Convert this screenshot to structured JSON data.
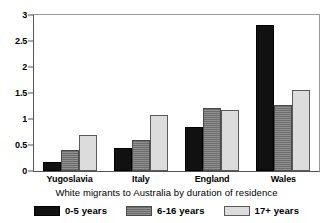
{
  "chart_data": {
    "type": "bar",
    "title": "",
    "subtitle": "",
    "xlabel": "White migrants to Australia by duration of residence",
    "ylabel": "",
    "categories": [
      "Yugoslavia",
      "Italy",
      "England",
      "Wales"
    ],
    "series": [
      {
        "name": "0-5 years",
        "values": [
          0.18,
          0.44,
          0.84,
          2.8
        ]
      },
      {
        "name": "6-16 years",
        "values": [
          0.4,
          0.6,
          1.22,
          1.26
        ]
      },
      {
        "name": "17+ years",
        "values": [
          0.69,
          1.07,
          1.17,
          1.55
        ]
      }
    ],
    "ylim": [
      0,
      3
    ],
    "yticks": [
      0,
      0.5,
      1,
      1.5,
      2,
      2.5,
      3
    ],
    "ytick_labels": [
      "0",
      "0.5",
      "1",
      "1.5",
      "2",
      "2.5",
      "3"
    ],
    "grid": false,
    "legend_position": "bottom",
    "colors": {
      "series_0": "#111111",
      "series_1": "#8f8f8f",
      "series_2": "#dcdcdc",
      "axis": "#555555",
      "background": "#ffffff",
      "text": "#000000"
    }
  }
}
